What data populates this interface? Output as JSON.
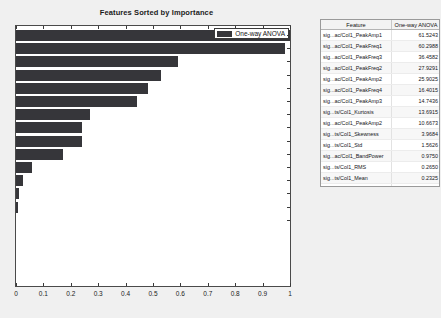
{
  "chart_data": {
    "type": "bar",
    "orientation": "horizontal",
    "title": "Features Sorted by Importance",
    "xlabel": "",
    "ylabel": "",
    "xlim": [
      0,
      1
    ],
    "xticks": [
      "0",
      "0.1",
      "0.2",
      "0.3",
      "0.4",
      "0.5",
      "0.6",
      "0.7",
      "0.8",
      "0.9",
      "1"
    ],
    "grid": false,
    "legend_position": "top-right",
    "legend": [
      "One-way ANOVA"
    ],
    "bar_color": "#36363a",
    "categories": [
      "sig...ac/Col1_PeakAmp1",
      "sig...ac/Col1_PeakFreq1",
      "sig...ac/Col1_PeakFreq3",
      "sig...ac/Col1_PeakAmp2",
      "sig...ac/Col1_PeakFreq4",
      "sig...ac/Col1_PeakAmp3",
      "sig...ts/Col1_Kurtosis",
      "sig...ac/Col1_PeakAmp2",
      "sig...ts/Col1_Skewness",
      "sig...ts/Col1_Std",
      "sig...ac/Col1_BandPower",
      "sig...ts/Col1_RMS",
      "sig...ts/Col1_Mean",
      "sig...ts/Col1_PeakValue"
    ],
    "values": [
      1.0,
      0.98,
      0.59,
      0.53,
      0.48,
      0.44,
      0.27,
      0.24,
      0.24,
      0.17,
      0.06,
      0.025,
      0.012,
      0.006
    ]
  },
  "table": {
    "columns": [
      "Feature",
      "One-way ANOVA"
    ],
    "rows": [
      {
        "feature": "sig...ac/Col1_PeakAmp1",
        "score": "61.5243"
      },
      {
        "feature": "sig...ac/Col1_PeakFreq1",
        "score": "60.2988"
      },
      {
        "feature": "sig...ac/Col1_PeakFreq3",
        "score": "36.4582"
      },
      {
        "feature": "sig...ac/Col1_PeakFreq2",
        "score": "27.9291"
      },
      {
        "feature": "sig...ac/Col1_PeakAmp2",
        "score": "25.9025"
      },
      {
        "feature": "sig...ac/Col1_PeakFreq4",
        "score": "16.4015"
      },
      {
        "feature": "sig...ac/Col1_PeakAmp3",
        "score": "14.7436"
      },
      {
        "feature": "sig...ts/Col1_Kurtosis",
        "score": "13.6915"
      },
      {
        "feature": "sig...ac/Col1_PeakAmp2",
        "score": "10.6673"
      },
      {
        "feature": "sig...ts/Col1_Skewness",
        "score": "3.9684"
      },
      {
        "feature": "sig...ts/Col1_Std",
        "score": "1.5626"
      },
      {
        "feature": "sig...ac/Col1_BandPower",
        "score": "0.9750"
      },
      {
        "feature": "sig...ts/Col1_RMS",
        "score": "0.2650"
      },
      {
        "feature": "sig...ts/Col1_Mean",
        "score": "0.2325"
      },
      {
        "feature": "sig...ts/Col1_PeakValue",
        "score": "0.0896"
      }
    ]
  }
}
